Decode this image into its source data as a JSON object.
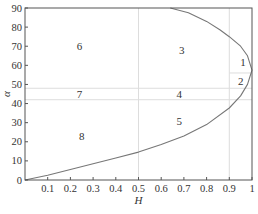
{
  "chart_data": {
    "type": "line",
    "title": "",
    "xlabel": "H",
    "ylabel": "α",
    "xlim": [
      0,
      1
    ],
    "ylim": [
      0,
      90
    ],
    "x_ticks": [
      0.1,
      0.2,
      0.3,
      0.4,
      0.5,
      0.6,
      0.7,
      0.8,
      0.9,
      1
    ],
    "x_tick_labels": [
      "0.1",
      "0.2",
      "0.3",
      "0.4",
      "0.5",
      "0.6",
      "0.7",
      "0.8",
      "0.9",
      "1"
    ],
    "y_ticks": [
      0,
      10,
      20,
      30,
      40,
      50,
      60,
      70,
      80,
      90
    ],
    "y_tick_labels": [
      "0",
      "10",
      "20",
      "30",
      "40",
      "50",
      "60",
      "70",
      "80",
      "90"
    ],
    "grid": false,
    "reference_lines": {
      "vertical": [
        {
          "x": 0.5,
          "y_range": [
            0,
            90
          ]
        },
        {
          "x": 0.9,
          "y_range": [
            0,
            90
          ]
        }
      ],
      "horizontal": [
        {
          "y": 48,
          "x_range": [
            0,
            1
          ]
        },
        {
          "y": 42,
          "x_range": [
            0,
            1
          ]
        },
        {
          "y": 56,
          "x_range": [
            0.9,
            1
          ]
        }
      ]
    },
    "series": [
      {
        "name": "boundary curve",
        "points": [
          [
            0.0,
            0
          ],
          [
            0.1,
            2.5
          ],
          [
            0.2,
            5.5
          ],
          [
            0.3,
            8.5
          ],
          [
            0.4,
            11.5
          ],
          [
            0.5,
            14.6
          ],
          [
            0.6,
            18.5
          ],
          [
            0.7,
            23
          ],
          [
            0.8,
            29
          ],
          [
            0.9,
            37.7
          ],
          [
            0.95,
            44
          ],
          [
            0.98,
            50
          ],
          [
            1.0,
            57.5
          ],
          [
            0.98,
            65
          ],
          [
            0.95,
            70
          ],
          [
            0.9,
            75
          ],
          [
            0.86,
            78.5
          ],
          [
            0.8,
            83
          ],
          [
            0.72,
            87.5
          ],
          [
            0.64,
            90
          ]
        ]
      }
    ],
    "annotations": [
      {
        "text": "1",
        "x": 0.96,
        "y": 62
      },
      {
        "text": "2",
        "x": 0.95,
        "y": 52
      },
      {
        "text": "3",
        "x": 0.69,
        "y": 68
      },
      {
        "text": "4",
        "x": 0.68,
        "y": 45
      },
      {
        "text": "5",
        "x": 0.68,
        "y": 31
      },
      {
        "text": "6",
        "x": 0.24,
        "y": 70
      },
      {
        "text": "7",
        "x": 0.24,
        "y": 45
      },
      {
        "text": "8",
        "x": 0.25,
        "y": 23
      }
    ],
    "legend": "none"
  }
}
